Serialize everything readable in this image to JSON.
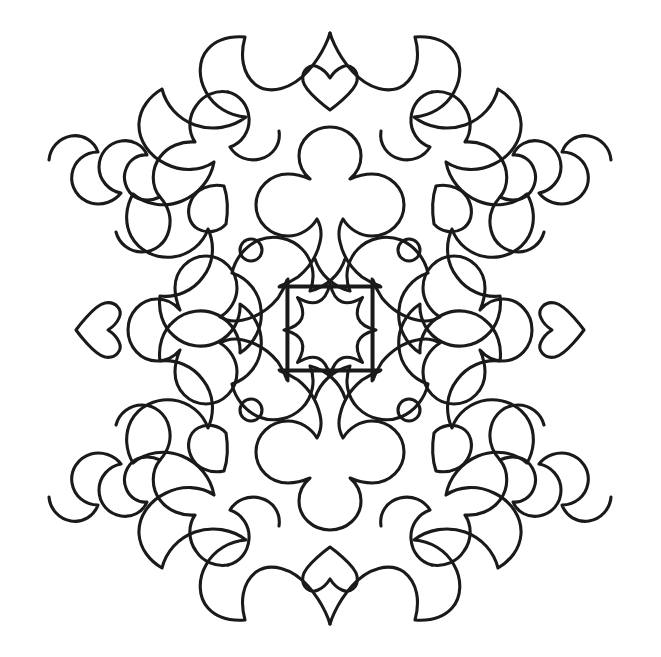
{
  "artwork": {
    "title": "Symmetric Mandala Coloring Page",
    "type": "line-art",
    "style": "black outline on white, uncolored coloring-book page",
    "symmetry": "4-fold mirror symmetry (vertical and horizontal axes)",
    "canvas": {
      "width": 661,
      "height": 657,
      "background_color": "#ffffff"
    },
    "line": {
      "color": "#1a1a1a",
      "width_px": 3,
      "fill": "none"
    },
    "center": {
      "x": 330,
      "y": 330
    },
    "motifs": [
      {
        "name": "center-star",
        "label": "Eight-pointed star with concave curved sides",
        "count": 1,
        "position": "center",
        "center": {
          "x": 330,
          "y": 330
        },
        "radius_outer": 46,
        "radius_inner": 30,
        "points": 8
      },
      {
        "name": "club-vertical",
        "label": "Club (clover) symbol with flared trumpet stem and flat base bar",
        "count": 2,
        "position": "top-center and bottom-center",
        "orientation": "top upright, bottom inverted"
      },
      {
        "name": "club-horizontal",
        "label": "Club symbol rotated sideways with flared stem ending in a straight vertical bar",
        "count": 2,
        "position": "left-center and right-center",
        "orientation": "left points right, right points left"
      },
      {
        "name": "small-heart-axis",
        "label": "Small heart outline on each cardinal axis just inside the outer border",
        "count": 4,
        "position": "top, bottom, left, right",
        "orientation": "top heart points down, bottom heart points up, side hearts point outward"
      },
      {
        "name": "teardrop-leaf",
        "label": "Small rounded teardrop / leaf shape with one pointed corner",
        "count": 4,
        "position": "four diagonal quadrants, inner ring"
      },
      {
        "name": "small-circle",
        "label": "Small plain circle dot",
        "count": 4,
        "position": "four diagonal quadrants, closer to center than the teardrops",
        "radius": 11
      },
      {
        "name": "outer-scallop-border",
        "label": "Scalloped outer silhouette of curved lobes ending in rolled spiral hooks",
        "count": 1,
        "position": "perimeter",
        "features": [
          "pointed peaks on vertical axis",
          "chevron notches on horizontal axis",
          "spiral hook terminals at diagonals"
        ]
      },
      {
        "name": "inner-scroll-ornament",
        "label": "Corner scroll ornament with rolled spiral terminal",
        "count": 4,
        "position": "four diagonal corners between border and center"
      }
    ],
    "palette": {
      "background": "#ffffff",
      "outline": "#1a1a1a"
    }
  }
}
